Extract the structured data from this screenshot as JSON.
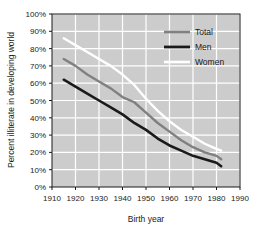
{
  "chart_data": {
    "type": "line",
    "title": "",
    "xlabel": "Birth year",
    "ylabel": "Percent illiterate in developing world",
    "xlim": [
      1910,
      1990
    ],
    "ylim": [
      0,
      100
    ],
    "xticks": [
      1910,
      1920,
      1930,
      1940,
      1950,
      1960,
      1970,
      1980,
      1990
    ],
    "xtick_labels": [
      "1910",
      "1920",
      "1930",
      "1940",
      "1950",
      "1960",
      "1970",
      "1980",
      "1990"
    ],
    "yticks": [
      0,
      10,
      20,
      30,
      40,
      50,
      60,
      70,
      80,
      90,
      100
    ],
    "ytick_labels": [
      "0%",
      "10%",
      "20%",
      "30%",
      "40%",
      "50%",
      "60%",
      "70%",
      "80%",
      "90%",
      "100%"
    ],
    "grid": true,
    "grid_color": "#ffffff",
    "plot_background": "#cccccc",
    "legend_position": "top-right",
    "series": [
      {
        "name": "Total",
        "color": "#808080",
        "x": [
          1915,
          1920,
          1925,
          1930,
          1935,
          1940,
          1945,
          1950,
          1955,
          1960,
          1965,
          1970,
          1975,
          1980,
          1982
        ],
        "values": [
          74,
          70,
          65,
          61,
          57,
          52,
          49,
          43,
          37,
          32,
          27,
          23,
          20,
          18,
          16
        ]
      },
      {
        "name": "Men",
        "color": "#1a1a1a",
        "x": [
          1915,
          1920,
          1925,
          1930,
          1935,
          1940,
          1945,
          1950,
          1955,
          1960,
          1965,
          1970,
          1975,
          1980,
          1982
        ],
        "values": [
          62,
          58,
          54,
          50,
          46,
          42,
          37,
          33,
          28,
          24,
          21,
          18,
          16,
          14,
          12
        ]
      },
      {
        "name": "Women",
        "color": "#ffffff",
        "x": [
          1915,
          1920,
          1925,
          1930,
          1935,
          1940,
          1945,
          1950,
          1955,
          1960,
          1965,
          1970,
          1975,
          1980,
          1982
        ],
        "values": [
          86,
          82,
          78,
          74,
          70,
          65,
          59,
          51,
          44,
          38,
          33,
          29,
          25,
          22,
          21
        ]
      }
    ]
  },
  "legend": {
    "items": [
      {
        "label": "Total",
        "color": "#808080"
      },
      {
        "label": "Men",
        "color": "#1a1a1a"
      },
      {
        "label": "Women",
        "color": "#ffffff"
      }
    ]
  },
  "axes": {
    "x_title": "Birth year",
    "y_title": "Percent illiterate in developing world"
  }
}
